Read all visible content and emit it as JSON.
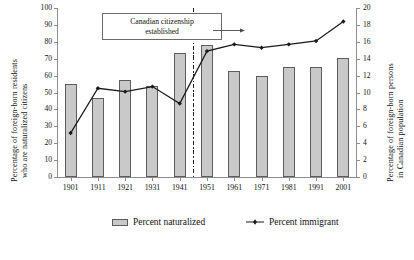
{
  "chart_data": {
    "type": "bar",
    "title": "",
    "subtitle": "",
    "xlabel": "",
    "categories": [
      "1901",
      "1911",
      "1921",
      "1931",
      "1941",
      "1951",
      "1961",
      "1971",
      "1981",
      "1991",
      "2001"
    ],
    "ylabel": "Percentage of foreign-born residents who are naturalized citizens",
    "ylabel_line1": "Percentage of foreign-born residents",
    "ylabel_line2": "who are naturalized citizens",
    "ylim": [
      0,
      100
    ],
    "yticks": [
      0,
      10,
      20,
      30,
      40,
      50,
      60,
      70,
      80,
      90,
      100
    ],
    "y2label": "Percentage of foreign-born persons in Canadian population",
    "y2label_line1": "Percentage of foreign-born persons",
    "y2label_line2": "in Canadian population",
    "y2lim": [
      0,
      20
    ],
    "y2ticks": [
      0,
      2,
      4,
      6,
      8,
      10,
      12,
      14,
      16,
      18,
      20
    ],
    "grid": false,
    "legend_position": "bottom",
    "series": [
      {
        "name": "Percent naturalized",
        "type": "bar",
        "axis": "left",
        "color": "#c9c9c9",
        "edge_color": "#5d5d5d",
        "values": [
          55.0,
          46.5,
          57.5,
          54.0,
          73.5,
          78.0,
          63.0,
          60.0,
          65.0,
          65.0,
          70.5
        ]
      },
      {
        "name": "Percent immigrant",
        "type": "line",
        "axis": "right",
        "color": "#1a1a1a",
        "marker": "diamond",
        "values": [
          5.2,
          10.5,
          10.1,
          10.7,
          8.7,
          14.9,
          15.7,
          15.3,
          15.7,
          16.1,
          18.4
        ]
      }
    ],
    "annotations": [
      {
        "text": "Canadian citizenship established",
        "text_line1": "Canadian citizenship",
        "text_line2": "established",
        "points_to": "1946",
        "marker": "vertical dash-dot line between 1941 and 1951"
      }
    ]
  },
  "legend": {
    "items": [
      {
        "label": "Percent naturalized",
        "icon": "bar-swatch-icon"
      },
      {
        "label": "Percent immigrant",
        "icon": "line-marker-icon"
      }
    ]
  }
}
